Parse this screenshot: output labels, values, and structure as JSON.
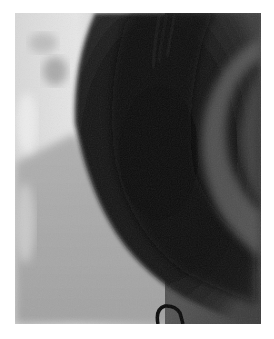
{
  "image": {
    "kind": "grayscale fluoroscopic x-ray",
    "frame": {
      "x": 15,
      "y": 13,
      "width": 246,
      "height": 311
    },
    "colors": {
      "background": "#ffffff",
      "bright_left_tissue": "#e4e4e4",
      "mid_left_tissue": "#b8b8b8",
      "lower_left_soft": "#a8a8a8",
      "dark_silhouette": "#141414",
      "silhouette_edge": "#3a3a3a",
      "right_gray_region": "#4a4a4a",
      "right_highlight_band": "#6a6a6a",
      "catheter_loop": "#0a0a0a"
    },
    "features": [
      "large dark curved silhouette occupying center",
      "bright soft-tissue region along left edge",
      "lighter gray band arcing on right side",
      "fine dark vertical streaks near top",
      "small dark loop (catheter tip) at bottom center"
    ]
  }
}
